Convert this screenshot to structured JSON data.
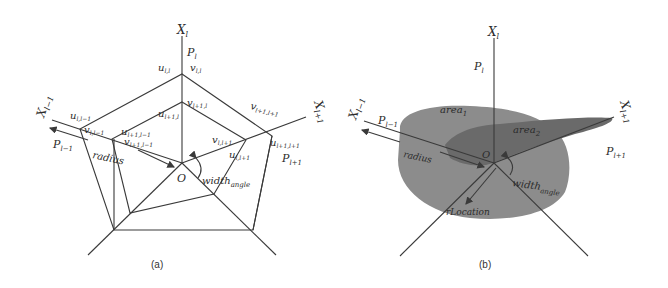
{
  "panel_a": {
    "caption": "(a)",
    "axes": {
      "x_l": "X_l",
      "x_l_minus_1": "X_{l-1}",
      "x_l_plus_1": "X_{l+1}"
    },
    "planes": {
      "p_l": "P_l",
      "p_l_minus_1": "P_{l-1}",
      "p_l_plus_1": "P_{l+1}"
    },
    "points": {
      "u_ll": "u_{l,l}",
      "v_ll": "v_{l,l}",
      "u_l_lm1": "u_{l,l-1}",
      "v_l_lm1": "v_{l,l-1}",
      "u_lp1_lm1": "u_{l+1,l-1}",
      "v_lp1_lm1": "v_{l+1,l-1}",
      "u_lp1_l": "u_{l+1,l}",
      "v_lp1_l": "v_{l+1,l}",
      "v_lp1_lp1": "v_{l+1,l+1}",
      "u_lp1_lp1": "u_{l+1,l+1}",
      "v_l_lp1": "v_{l,l+1}",
      "u_l_lp1": "u_{l,l+1}"
    },
    "origin": "O",
    "radius": "radius",
    "width_angle": "width",
    "width_angle_sub": "angle"
  },
  "panel_b": {
    "caption": "(b)",
    "axes": {
      "x_l": "X_l",
      "x_l_minus_1": "X_{l-1}",
      "x_l_plus_1": "X_{l+1}"
    },
    "planes": {
      "p_l": "P_l",
      "p_l_minus_1": "P_{l-1}",
      "p_l_plus_1": "P_{l+1}"
    },
    "area1": "area",
    "area1_sub": "1",
    "area2": "area",
    "area2_sub": "2",
    "origin": "O",
    "radius": "radius",
    "width_angle": "width",
    "width_angle_sub": "angle",
    "r_location": "rLocation",
    "colors": {
      "area1_fill": "#8a8a8a",
      "area2_fill": "#6e6e6e"
    }
  },
  "labels_plain": {
    "X": "X",
    "P": "P",
    "u": "u",
    "v": "v",
    "l": "l",
    "lm1": "l−1",
    "lp1": "l+1",
    "ll": "l,l",
    "l_lm1": "l,l−1",
    "lp1_lm1": "l+1,l−1",
    "lp1_l": "l+1,l",
    "lp1_lp1": "l+1,l+1",
    "l_lp1": "l,l+1"
  }
}
